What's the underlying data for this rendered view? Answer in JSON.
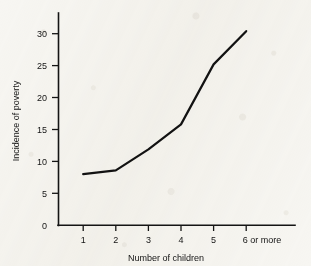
{
  "figure": {
    "background_color": "#f7f6f2",
    "ink_color": "#141414"
  },
  "chart_data": {
    "type": "line",
    "title": "",
    "subtitle": "",
    "xlabel": "Number of children",
    "ylabel": "Incidence of poverty",
    "categories": [
      "1",
      "2",
      "3",
      "4",
      "5",
      "6 or more"
    ],
    "values": [
      8.0,
      8.6,
      11.9,
      15.8,
      25.2,
      30.4
    ],
    "series": [
      {
        "name": "Incidence of poverty",
        "values": [
          8.0,
          8.6,
          11.9,
          15.8,
          25.2,
          30.4
        ]
      }
    ],
    "ylim": [
      0,
      32
    ],
    "yticks": [
      0,
      5,
      10,
      15,
      20,
      25,
      30
    ],
    "ytick_labels": [
      "0",
      "5",
      "10",
      "15",
      "20",
      "25",
      "30"
    ],
    "xtick_labels": [
      "1",
      "2",
      "3",
      "4",
      "5",
      "6 or more"
    ],
    "grid": false,
    "legend": null,
    "legend_position": "none",
    "annotations": [],
    "tick_direction": "out",
    "spines": [
      "left",
      "bottom"
    ]
  }
}
